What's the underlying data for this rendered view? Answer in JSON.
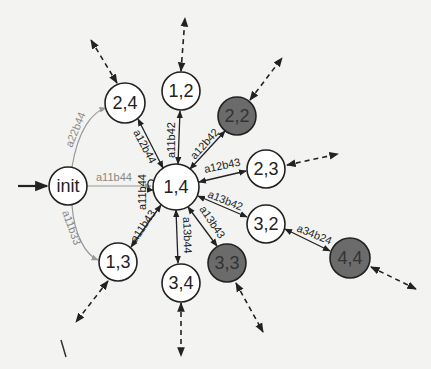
{
  "diagram": {
    "type": "state-transition-graph",
    "colors": {
      "background": "#f3f3f1",
      "node_fill": "#ffffff",
      "node_fill_accepting": "#6b6b6b",
      "edge": "#222222",
      "edge_init": "#9a9a9a"
    },
    "nodes": [
      {
        "id": "init",
        "label": "init",
        "x": 68,
        "y": 186,
        "r": 19,
        "dark": false
      },
      {
        "id": "n24",
        "label": "2,4",
        "x": 125,
        "y": 103,
        "r": 20,
        "dark": false
      },
      {
        "id": "n12",
        "label": "1,2",
        "x": 181,
        "y": 91,
        "r": 19,
        "dark": false
      },
      {
        "id": "n22",
        "label": "2,2",
        "x": 237,
        "y": 116,
        "r": 19,
        "dark": true
      },
      {
        "id": "n23",
        "label": "2,3",
        "x": 266,
        "y": 169,
        "r": 19,
        "dark": false
      },
      {
        "id": "n14",
        "label": "1,4",
        "x": 176,
        "y": 187,
        "r": 23,
        "dark": false
      },
      {
        "id": "n32",
        "label": "3,2",
        "x": 266,
        "y": 224,
        "r": 19,
        "dark": false
      },
      {
        "id": "n44",
        "label": "4,4",
        "x": 350,
        "y": 258,
        "r": 20,
        "dark": true
      },
      {
        "id": "n33",
        "label": "3,3",
        "x": 227,
        "y": 263,
        "r": 19,
        "dark": true
      },
      {
        "id": "n34",
        "label": "3,4",
        "x": 181,
        "y": 283,
        "r": 19,
        "dark": false
      },
      {
        "id": "n13",
        "label": "1,3",
        "x": 118,
        "y": 262,
        "r": 19,
        "dark": false
      }
    ],
    "edges": [
      {
        "from": "init",
        "to": "n14",
        "label": "a11b44",
        "style": "grey"
      },
      {
        "from": "init",
        "to": "n24",
        "label": "a22b44",
        "style": "grey-curve"
      },
      {
        "from": "init",
        "to": "n13",
        "label": "a11b33",
        "style": "grey-curve"
      },
      {
        "from": "n14",
        "to": "n24",
        "label": "a12b44",
        "style": "bidirectional"
      },
      {
        "from": "n14",
        "to": "n12",
        "label": "a11b42",
        "style": "bidirectional"
      },
      {
        "from": "n14",
        "to": "n22",
        "label": "a12b42",
        "style": "bidirectional"
      },
      {
        "from": "n14",
        "to": "n23",
        "label": "a12b43",
        "style": "bidirectional"
      },
      {
        "from": "n14",
        "to": "n32",
        "label": "a13b42",
        "style": "bidirectional"
      },
      {
        "from": "n14",
        "to": "n33",
        "label": "a13b43",
        "style": "bidirectional"
      },
      {
        "from": "n14",
        "to": "n34",
        "label": "a13b44",
        "style": "bidirectional"
      },
      {
        "from": "n14",
        "to": "n13",
        "label": "a11b43",
        "style": "bidirectional"
      },
      {
        "from": "n14",
        "to": "n14",
        "label": "a11b44",
        "style": "self-loop"
      },
      {
        "from": "n32",
        "to": "n44",
        "label": "a34b24",
        "style": "bidirectional"
      }
    ],
    "edge_labels": {
      "init_14": "a11b44",
      "init_24": "a22b44",
      "init_13": "a11b33",
      "e14_24": "a12b44",
      "e14_12": "a11b42",
      "e14_22": "a12b42",
      "e14_23": "a12b43",
      "e14_32": "a13b42",
      "e14_33": "a13b43",
      "e14_34": "a13b44",
      "e14_13": "a11b43",
      "self_14": "a11b44",
      "e32_44": "a34b24"
    },
    "node_labels": {
      "init": "init",
      "n24": "2,4",
      "n12": "1,2",
      "n22": "2,2",
      "n23": "2,3",
      "n14": "1,4",
      "n32": "3,2",
      "n44": "4,4",
      "n33": "3,3",
      "n34": "3,4",
      "n13": "1,3"
    },
    "dashed_outgoing": [
      "n24",
      "n12",
      "n22",
      "n23",
      "n44",
      "n33",
      "n34",
      "n13"
    ]
  }
}
